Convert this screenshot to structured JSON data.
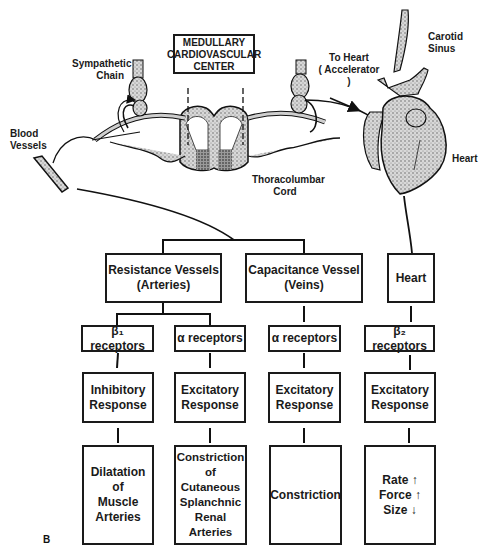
{
  "figure": {
    "letter": "B"
  },
  "illustration": {
    "medullary_center": "MEDULLARY\nCARDIOVASCULAR\nCENTER",
    "sympathetic_chain": "Sympathetic\nChain",
    "blood_vessels": "Blood\nVessels",
    "to_heart": "To Heart\n( Accelerator )",
    "carotid_sinus": "Carotid\nSinus",
    "heart": "Heart",
    "thoracolumbar_cord": "Thoracolumbar\nCord"
  },
  "flowchart": {
    "level1": [
      {
        "id": "resistance",
        "text": "Resistance Vessels\n(Arteries)"
      },
      {
        "id": "capacitance",
        "text": "Capacitance Vessel\n(Veins)"
      },
      {
        "id": "heart",
        "text": "Heart"
      }
    ],
    "receptors": [
      {
        "id": "beta1",
        "text": "β₁ receptors"
      },
      {
        "id": "alpha-arteries",
        "text": "α receptors"
      },
      {
        "id": "alpha-veins",
        "text": "α receptors"
      },
      {
        "id": "beta2",
        "text": "β₂ receptors"
      }
    ],
    "responses": [
      {
        "id": "inhibitory",
        "text": "Inhibitory\nResponse"
      },
      {
        "id": "excitatory-arteries",
        "text": "Excitatory\nResponse"
      },
      {
        "id": "excitatory-veins",
        "text": "Excitatory\nResponse"
      },
      {
        "id": "excitatory-heart",
        "text": "Excitatory\nResponse"
      }
    ],
    "effects": [
      {
        "id": "dilatation",
        "text": "Dilatation\nof\nMuscle\nArteries"
      },
      {
        "id": "constriction-arteries",
        "text": "Constriction\nof\nCutaneous\nSplanchnic\nRenal\nArteries"
      },
      {
        "id": "constriction-veins",
        "text": "Constriction"
      },
      {
        "id": "heart-effects",
        "text": "Rate ↑\nForce ↑\nSize ↓"
      }
    ]
  }
}
